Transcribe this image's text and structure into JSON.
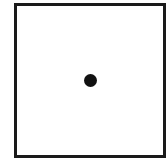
{
  "diagram": {
    "shapes": [
      {
        "type": "square-outline",
        "fill": "#ffffff",
        "stroke": "#1a1a1a"
      },
      {
        "type": "filled-dot",
        "fill": "#111111",
        "position": "center"
      }
    ]
  }
}
